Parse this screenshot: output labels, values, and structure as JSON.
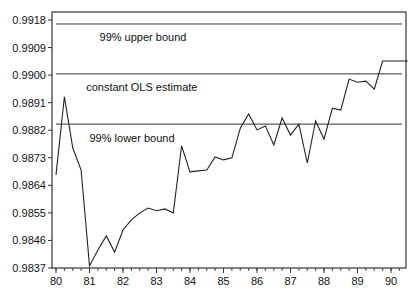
{
  "chart_data": {
    "type": "line",
    "title": "",
    "xlabel": "",
    "ylabel": "",
    "ylim": [
      0.9837,
      0.9918
    ],
    "xlim": [
      80,
      90.9
    ],
    "grid": false,
    "y_ticks": [
      "0.9837",
      "0.9846",
      "0.9855",
      "0.9864",
      "0.9873",
      "0.9882",
      "0.9891",
      "0.9900",
      "0.9909",
      "0.9918"
    ],
    "y_tick_values": [
      0.9837,
      0.9846,
      0.9855,
      0.9864,
      0.9873,
      0.9882,
      0.9891,
      0.99,
      0.9909,
      0.9918
    ],
    "x_ticks": [
      "80",
      "81",
      "82",
      "83",
      "84",
      "85",
      "86",
      "87",
      "88",
      "89",
      "90"
    ],
    "x_tick_values": [
      80,
      81,
      82,
      83,
      84,
      85,
      86,
      87,
      88,
      89,
      90
    ],
    "reference_lines": [
      {
        "name": "99% upper bound",
        "value": 0.99167
      },
      {
        "name": "constant OLS estimate",
        "value": 0.99004
      },
      {
        "name": "99% lower bound",
        "value": 0.9884
      }
    ],
    "annotations": [
      {
        "text": "99% upper bound",
        "x": 81.3,
        "y": 0.99125
      },
      {
        "text": "constant OLS estimate",
        "x": 80.9,
        "y": 0.9896
      },
      {
        "text": "99% lower bound",
        "x": 81.0,
        "y": 0.98795
      }
    ],
    "series": [
      {
        "name": "recursive estimate",
        "x": [
          80.0,
          80.25,
          80.5,
          80.75,
          81.0,
          81.25,
          81.5,
          81.75,
          82.0,
          82.25,
          82.5,
          82.75,
          83.0,
          83.25,
          83.5,
          83.75,
          84.0,
          84.25,
          84.5,
          84.75,
          85.0,
          85.25,
          85.5,
          85.75,
          86.0,
          86.25,
          86.5,
          86.75,
          87.0,
          87.25,
          87.5,
          87.75,
          88.0,
          88.25,
          88.5,
          88.75,
          89.0,
          89.25,
          89.5,
          89.75,
          90.0,
          90.25,
          90.5
        ],
        "values": [
          0.98674,
          0.98929,
          0.98762,
          0.9869,
          0.98377,
          0.98429,
          0.98475,
          0.98422,
          0.98494,
          0.98527,
          0.9855,
          0.98566,
          0.98557,
          0.98563,
          0.9855,
          0.98769,
          0.98684,
          0.98687,
          0.9869,
          0.98733,
          0.98723,
          0.9873,
          0.98827,
          0.98873,
          0.98821,
          0.98834,
          0.98772,
          0.9886,
          0.98804,
          0.9884,
          0.98713,
          0.9885,
          0.98791,
          0.98892,
          0.98886,
          0.98987,
          0.98977,
          0.9898,
          0.98954,
          0.99046,
          0.99046,
          0.99046,
          0.99046
        ]
      }
    ]
  }
}
